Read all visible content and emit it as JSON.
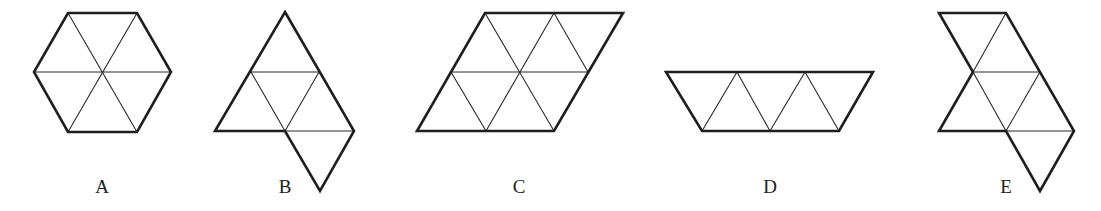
{
  "figure": {
    "options": [
      {
        "id": "A",
        "label": "A",
        "shape": "hexagon",
        "triangles": 6,
        "label_x": 102
      },
      {
        "id": "B",
        "label": "B",
        "shape": "triangle with extra triangle below",
        "triangles": 6,
        "label_x": 285
      },
      {
        "id": "C",
        "label": "C",
        "shape": "parallelogram",
        "triangles": 8,
        "label_x": 519
      },
      {
        "id": "D",
        "label": "D",
        "shape": "trapezoid",
        "triangles": 5,
        "label_x": 770
      },
      {
        "id": "E",
        "label": "E",
        "shape": "irregular",
        "triangles": 6,
        "label_x": 1006
      }
    ]
  },
  "colors": {
    "line": "#1e1e1e",
    "background": "#ffffff"
  }
}
